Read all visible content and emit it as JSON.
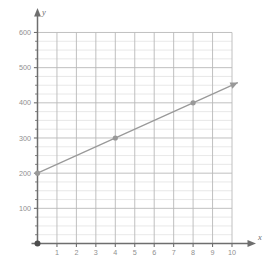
{
  "chart_data": {
    "type": "line",
    "title": "",
    "xlabel": "x",
    "ylabel": "y",
    "xlim": [
      0,
      10.6
    ],
    "ylim": [
      0,
      640
    ],
    "grid": true,
    "legend_position": "none",
    "x_major_ticks": [
      1,
      2,
      3,
      4,
      5,
      6,
      7,
      8,
      9,
      10
    ],
    "x_tick_labels": [
      "1",
      "2",
      "3",
      "4",
      "5",
      "6",
      "7",
      "8",
      "9",
      "10"
    ],
    "y_major_ticks": [
      100,
      200,
      300,
      400,
      500,
      600
    ],
    "y_tick_labels": [
      "100",
      "200",
      "300",
      "400",
      "500",
      "600"
    ],
    "y_minor_step": 25,
    "x_minor_step": 1,
    "series": [
      {
        "name": "line",
        "color": "#999999",
        "slope": 25,
        "intercept": 200,
        "arrow_end": true,
        "x": [
          0,
          10.3
        ],
        "values": [
          200,
          457.5
        ],
        "points": [
          {
            "x": 0,
            "y": 200
          },
          {
            "x": 4,
            "y": 300
          },
          {
            "x": 8,
            "y": 400
          }
        ]
      }
    ],
    "origin_marker": {
      "x": 0,
      "y": 0,
      "color": "#4d4d4d"
    },
    "colors": {
      "axis": "#6e6e6e",
      "major_grid": "#b9b9b9",
      "minor_grid": "#dedede",
      "line": "#9a9a9a",
      "point": "#9a9a9a",
      "tick_text": "#8f8f8f",
      "background": "#ffffff"
    }
  }
}
